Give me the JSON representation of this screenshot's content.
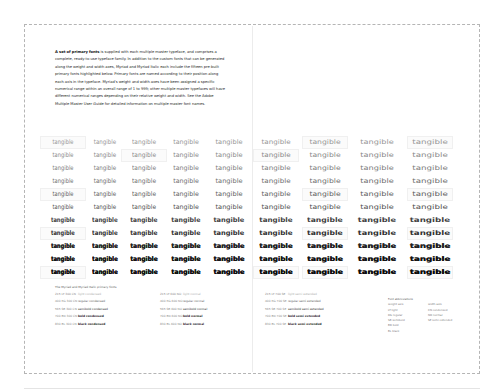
{
  "document": {
    "intro": {
      "lead": "A set of primary fonts",
      "body": " is supplied with each multiple master typeface, and comprises a complete, ready-to-use typeface family. In addition to the custom fonts that can be generated along the weight and width axes, Myriad and Myriad Italic each include the fifteen pre-built primary fonts highlighted below. Primary fonts are named according to their position along each axis in the typeface. Myriad's weight and width axes have been assigned a specific numerical range within an overall range of 1 to 999; other multiple master typefaces will have different numerical ranges depending on their relative weight and width. See the Adobe Multiple Master User Guide for detailed information on multiple master font names."
    },
    "specimen_word": "tangible",
    "grid": {
      "columns": 9,
      "rows": 11,
      "column_x": [
        27,
        69,
        108,
        150,
        193,
        240,
        289,
        341,
        394
      ],
      "row_y": [
        0,
        13,
        26,
        39,
        52,
        65,
        78,
        91,
        104,
        117,
        130
      ],
      "row_weights": [
        200,
        260,
        320,
        380,
        450,
        520,
        590,
        660,
        730,
        800,
        830
      ],
      "column_stretch": [
        0.8,
        0.86,
        0.92,
        0.98,
        1.04,
        1.12,
        1.2,
        1.28,
        1.36
      ],
      "highlights": [
        {
          "row": 0,
          "col": 0
        },
        {
          "row": 1,
          "col": 2
        },
        {
          "row": 4,
          "col": 0
        },
        {
          "row": 7,
          "col": 0
        },
        {
          "row": 10,
          "col": 0
        },
        {
          "row": 0,
          "col": 6
        },
        {
          "row": 1,
          "col": 5
        },
        {
          "row": 4,
          "col": 6
        },
        {
          "row": 7,
          "col": 6
        },
        {
          "row": 10,
          "col": 6
        },
        {
          "row": 0,
          "col": 8
        },
        {
          "row": 4,
          "col": 8
        },
        {
          "row": 7,
          "col": 8
        },
        {
          "row": 10,
          "col": 5
        },
        {
          "row": 10,
          "col": 8
        }
      ]
    },
    "caption_title": "The Myriad and Myriad Italic primary fonts",
    "primary_fonts": {
      "condensed": [
        {
          "code": "215 LT 300 CN",
          "name": "light condensed"
        },
        {
          "code": "400 RG 300 CN",
          "name": "regular condensed"
        },
        {
          "code": "565 SB 300 CN",
          "name": "semibold condensed"
        },
        {
          "code": "700 BD 300 CN",
          "name": "bold condensed"
        },
        {
          "code": "830 BL 300 CN",
          "name": "black condensed"
        }
      ],
      "normal": [
        {
          "code": "215 LT 600 NO",
          "name": "light normal"
        },
        {
          "code": "400 RG 600 NO",
          "name": "regular normal"
        },
        {
          "code": "565 SB 600 NO",
          "name": "semibold normal"
        },
        {
          "code": "700 BD 600 NO",
          "name": "bold normal"
        },
        {
          "code": "830 BL 600 NO",
          "name": "black normal"
        }
      ],
      "semi_extended": [
        {
          "code": "215 LT 700 SE",
          "name": "light semi extended"
        },
        {
          "code": "400 RG 700 SE",
          "name": "regular semi extended"
        },
        {
          "code": "565 SB 700 SE",
          "name": "semibold semi extended"
        },
        {
          "code": "700 BD 700 SE",
          "name": "bold semi extended"
        },
        {
          "code": "830 BL 700 SE",
          "name": "black semi extended"
        }
      ]
    },
    "abbreviations": {
      "title": "Font abbreviations",
      "weight_header": "weight axis",
      "width_header": "width axis",
      "weight": [
        "LT  light",
        "RG  regular",
        "SB  semibold",
        "BD  bold",
        "BL  black"
      ],
      "width": [
        "CN  condensed",
        "NO  normal",
        "SE  semi extended"
      ]
    }
  },
  "colors": {
    "text": "#1a1a1a",
    "frame": "#b5b5b5",
    "highlight": "#fbfbfb"
  }
}
